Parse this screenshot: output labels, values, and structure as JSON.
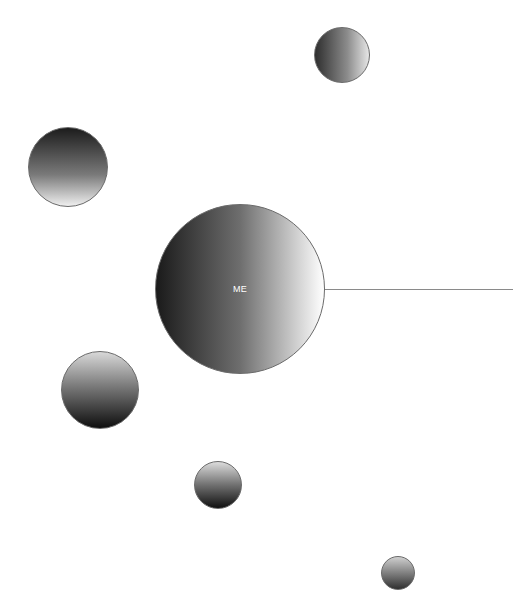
{
  "diagram": {
    "center_node": {
      "label": "ME",
      "cx": 240,
      "cy": 289,
      "r": 85,
      "gradient": "linear-gradient(to right, #1a1a1a 0%, #6e6e6e 50%, #ffffff 100%)"
    },
    "connector": {
      "x1": 325,
      "x2": 513,
      "y": 289
    },
    "nodes": [
      {
        "id": "node-top-right",
        "cx": 342,
        "cy": 55,
        "r": 28,
        "gradient": "linear-gradient(to right, #2e2e2e 0%, #8c8c8c 60%, #e6e6e6 100%)"
      },
      {
        "id": "node-left",
        "cx": 68,
        "cy": 167,
        "r": 40,
        "gradient": "linear-gradient(to bottom, #1c1c1c 0%, #7a7a7a 60%, #efefef 100%)"
      },
      {
        "id": "node-lower-left",
        "cx": 100,
        "cy": 390,
        "r": 39,
        "gradient": "linear-gradient(to bottom, #d8d8d8 0%, #7a7a7a 45%, #0e0e0e 100%)"
      },
      {
        "id": "node-bottom-center",
        "cx": 218,
        "cy": 485,
        "r": 24,
        "gradient": "linear-gradient(to bottom, #dcdcdc 0%, #707070 50%, #101010 100%)"
      },
      {
        "id": "node-bottom-right",
        "cx": 398,
        "cy": 573,
        "r": 17,
        "gradient": "linear-gradient(to bottom, #cfcfcf 0%, #707070 60%, #303030 100%)"
      }
    ]
  }
}
